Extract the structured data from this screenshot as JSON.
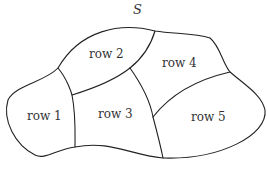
{
  "diagram": {
    "set_label": "S",
    "regions": [
      {
        "id": "row1",
        "label": "row 1",
        "x": 27,
        "y": 110
      },
      {
        "id": "row2",
        "label": "row 2",
        "x": 89,
        "y": 48
      },
      {
        "id": "row3",
        "label": "row 3",
        "x": 98,
        "y": 108
      },
      {
        "id": "row4",
        "label": "row 4",
        "x": 162,
        "y": 57
      },
      {
        "id": "row5",
        "label": "row 5",
        "x": 191,
        "y": 111
      }
    ],
    "colors": {
      "stroke": "#222222",
      "background": "#ffffff",
      "text": "#333333"
    }
  }
}
